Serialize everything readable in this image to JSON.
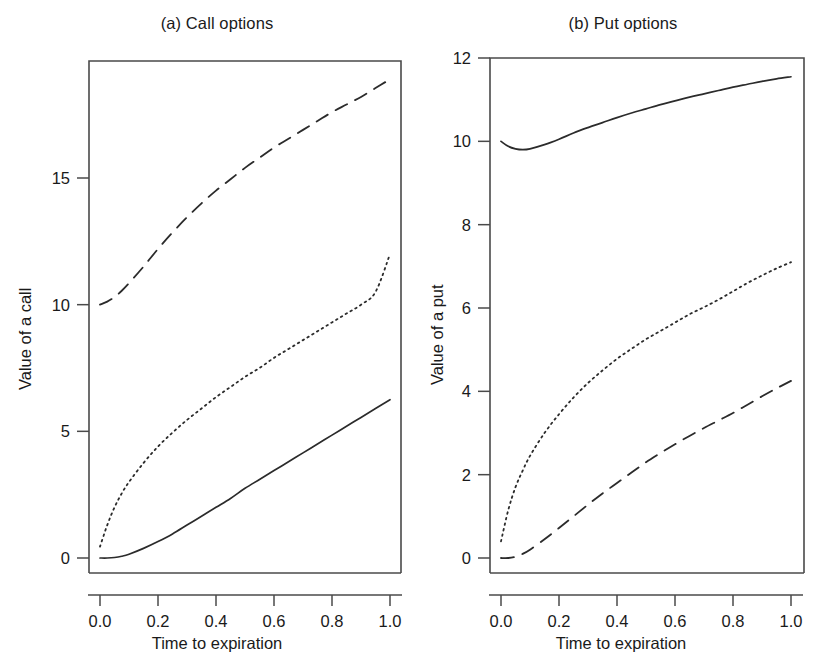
{
  "figure": {
    "background": "#ffffff",
    "line_color": "#2b2b2b",
    "axis_color": "#4a4a4a"
  },
  "panels": [
    {
      "id": "a",
      "title": "(a) Call options",
      "xlabel": "Time to expiration",
      "ylabel": "Value of a call",
      "xticks": [
        "0.0",
        "0.2",
        "0.4",
        "0.6",
        "0.8",
        "1.0"
      ],
      "yticks": [
        "0",
        "5",
        "10",
        "15"
      ]
    },
    {
      "id": "b",
      "title": "(b) Put options",
      "xlabel": "Time to expiration",
      "ylabel": "Value of a put",
      "xticks": [
        "0.0",
        "0.2",
        "0.4",
        "0.6",
        "0.8",
        "1.0"
      ],
      "yticks": [
        "0",
        "2",
        "4",
        "6",
        "8",
        "10",
        "12"
      ]
    }
  ],
  "chart_data": [
    {
      "type": "line",
      "title": "(a) Call options",
      "xlabel": "Time to expiration",
      "ylabel": "Value of a call",
      "xlim": [
        -0.035,
        1.045
      ],
      "ylim": [
        -0.75,
        19.6
      ],
      "xticks": [
        0.0,
        0.2,
        0.4,
        0.6,
        0.8,
        1.0
      ],
      "yticks": [
        0,
        5,
        10,
        15
      ],
      "grid": false,
      "legend": "none",
      "x": [
        0.0,
        0.025,
        0.05,
        0.075,
        0.1,
        0.15,
        0.2,
        0.25,
        0.3,
        0.35,
        0.4,
        0.45,
        0.5,
        0.55,
        0.6,
        0.65,
        0.7,
        0.75,
        0.8,
        0.85,
        0.9,
        0.95,
        1.0
      ],
      "series": [
        {
          "name": "in-the-money call",
          "style": "dashed",
          "values": [
            10.0,
            10.12,
            10.3,
            10.55,
            10.85,
            11.5,
            12.2,
            12.85,
            13.45,
            14.0,
            14.5,
            14.95,
            15.4,
            15.8,
            16.2,
            16.55,
            16.9,
            17.25,
            17.6,
            17.9,
            18.2,
            18.55,
            18.9
          ]
        },
        {
          "name": "at-the-money call",
          "style": "dotted",
          "values": [
            0.45,
            1.3,
            2.0,
            2.55,
            3.0,
            3.75,
            4.4,
            4.95,
            5.45,
            5.9,
            6.35,
            6.75,
            7.15,
            7.5,
            7.9,
            8.25,
            8.6,
            8.95,
            9.3,
            9.65,
            10.0,
            10.5,
            12.0
          ]
        },
        {
          "name": "out-of-the-money call",
          "style": "solid",
          "values": [
            0.0,
            0.0,
            0.02,
            0.07,
            0.15,
            0.38,
            0.65,
            0.95,
            1.3,
            1.65,
            2.0,
            2.35,
            2.75,
            3.1,
            3.45,
            3.8,
            4.15,
            4.5,
            4.85,
            5.2,
            5.55,
            5.9,
            6.25
          ]
        }
      ]
    },
    {
      "type": "line",
      "title": "(b) Put options",
      "xlabel": "Time to expiration",
      "ylabel": "Value of a put",
      "xlim": [
        -0.035,
        1.045
      ],
      "ylim": [
        -0.5,
        12.5
      ],
      "xticks": [
        0.0,
        0.2,
        0.4,
        0.6,
        0.8,
        1.0
      ],
      "yticks": [
        0,
        2,
        4,
        6,
        8,
        10,
        12
      ],
      "grid": false,
      "legend": "none",
      "x": [
        0.0,
        0.025,
        0.05,
        0.075,
        0.1,
        0.15,
        0.2,
        0.25,
        0.3,
        0.35,
        0.4,
        0.45,
        0.5,
        0.55,
        0.6,
        0.65,
        0.7,
        0.75,
        0.8,
        0.85,
        0.9,
        0.95,
        1.0
      ],
      "series": [
        {
          "name": "in-the-money put",
          "style": "solid",
          "values": [
            10.0,
            9.88,
            9.82,
            9.8,
            9.82,
            9.92,
            10.05,
            10.2,
            10.33,
            10.45,
            10.57,
            10.68,
            10.78,
            10.88,
            10.97,
            11.06,
            11.14,
            11.22,
            11.3,
            11.37,
            11.44,
            11.5,
            11.55
          ]
        },
        {
          "name": "at-the-money put",
          "style": "dotted",
          "values": [
            0.4,
            1.15,
            1.7,
            2.1,
            2.45,
            3.0,
            3.45,
            3.85,
            4.2,
            4.5,
            4.78,
            5.02,
            5.25,
            5.45,
            5.65,
            5.85,
            6.02,
            6.2,
            6.4,
            6.6,
            6.78,
            6.95,
            7.1
          ]
        },
        {
          "name": "out-of-the-money put",
          "style": "dashed",
          "values": [
            0.0,
            0.0,
            0.03,
            0.1,
            0.2,
            0.45,
            0.72,
            1.0,
            1.28,
            1.55,
            1.8,
            2.05,
            2.3,
            2.52,
            2.73,
            2.93,
            3.12,
            3.3,
            3.48,
            3.68,
            3.88,
            4.07,
            4.25
          ]
        }
      ]
    }
  ]
}
